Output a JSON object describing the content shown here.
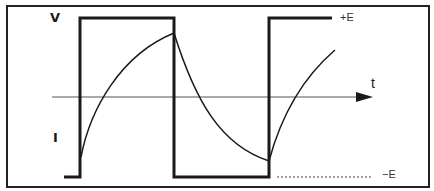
{
  "diagram": {
    "labels": {
      "voltage": "V",
      "current": "I",
      "time_axis": "t",
      "positive_level": "+E",
      "negative_level": "−E"
    },
    "colors": {
      "line": "#1a1a1a",
      "frame": "#222222",
      "axis": "#555555",
      "background": "#ffffff"
    },
    "square_wave": {
      "points": "64,177 80,177 80,18 174,18 174,177 269,177 269,18 332,18"
    },
    "response_curves": [
      {
        "name": "rise-1",
        "path": "M 81 157 C 90 110, 120 55, 174 33"
      },
      {
        "name": "fall-1",
        "path": "M 174 33 C 195 100, 220 145, 269 161"
      },
      {
        "name": "rise-2",
        "path": "M 269 161 C 280 120, 300 80, 335 50"
      }
    ],
    "time_axis": {
      "x1": 52,
      "y": 97,
      "x2": 372
    },
    "negative_level_dotted": {
      "x1": 277,
      "x2": 373,
      "y": 177
    }
  }
}
